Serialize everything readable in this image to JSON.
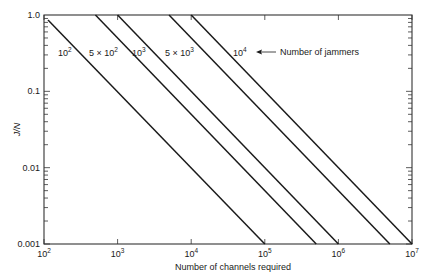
{
  "chart_data": {
    "type": "line",
    "title": "",
    "xlabel": "Number of channels required",
    "ylabel": "J/N",
    "xscale": "log",
    "yscale": "log",
    "xlim": [
      100,
      10000000
    ],
    "ylim": [
      0.001,
      1.0
    ],
    "grid": false,
    "x_ticks": [
      {
        "value": 100,
        "base": "10",
        "exp": "2"
      },
      {
        "value": 1000,
        "base": "10",
        "exp": "3"
      },
      {
        "value": 10000,
        "base": "10",
        "exp": "4"
      },
      {
        "value": 100000,
        "base": "10",
        "exp": "5"
      },
      {
        "value": 1000000,
        "base": "10",
        "exp": "6"
      },
      {
        "value": 10000000,
        "base": "10",
        "exp": "7"
      }
    ],
    "y_ticks": [
      {
        "value": 1.0,
        "label": "1.0"
      },
      {
        "value": 0.1,
        "label": "0.1"
      },
      {
        "value": 0.01,
        "label": "0.01"
      },
      {
        "value": 0.001,
        "label": "0.001"
      }
    ],
    "series": [
      {
        "name": "10^2",
        "label_main": "10",
        "label_exp": "2",
        "label_prefix": "",
        "jammers": 100,
        "points": [
          [
            100,
            1.0
          ],
          [
            100000,
            0.001
          ]
        ]
      },
      {
        "name": "5 x 10^2",
        "label_main": "10",
        "label_exp": "2",
        "label_prefix": "5 × ",
        "jammers": 500,
        "points": [
          [
            500,
            1.0
          ],
          [
            500000,
            0.001
          ]
        ]
      },
      {
        "name": "10^3",
        "label_main": "10",
        "label_exp": "3",
        "label_prefix": "",
        "jammers": 1000,
        "points": [
          [
            1000,
            1.0
          ],
          [
            1000000,
            0.001
          ]
        ]
      },
      {
        "name": "5 x 10^3",
        "label_main": "10",
        "label_exp": "3",
        "label_prefix": "5 × ",
        "jammers": 5000,
        "points": [
          [
            5000,
            1.0
          ],
          [
            5000000,
            0.001
          ]
        ]
      },
      {
        "name": "10^4",
        "label_main": "10",
        "label_exp": "4",
        "label_prefix": "",
        "jammers": 10000,
        "points": [
          [
            10000,
            1.0
          ],
          [
            10000000,
            0.001
          ]
        ]
      }
    ],
    "annotations": [
      {
        "text": "Number of jammers",
        "arrow_to": "10^4 label"
      }
    ]
  }
}
